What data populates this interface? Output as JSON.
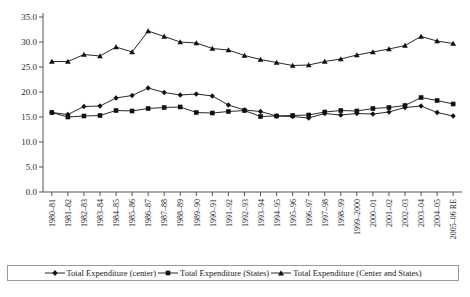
{
  "chart_data": {
    "type": "line",
    "title": "",
    "xlabel": "",
    "ylabel": "",
    "ylim": [
      0.0,
      35.0
    ],
    "yticks": [
      "0.0",
      "5.0",
      "10.0",
      "15.0",
      "20.0",
      "25.0",
      "30.0",
      "35.0"
    ],
    "ytick_values": [
      0.0,
      5.0,
      10.0,
      15.0,
      20.0,
      25.0,
      30.0,
      35.0
    ],
    "grid": false,
    "legend_position": "bottom",
    "categories": [
      "1980–81",
      "1981–82",
      "1982–83",
      "1983–84",
      "1984–85",
      "1985–86",
      "1986–87",
      "1987–88",
      "1988–89",
      "1989–90",
      "1990–91",
      "1991–92",
      "1992–93",
      "1993–94",
      "1994–95",
      "1995–96",
      "1996–97",
      "1997–98",
      "1998–99",
      "1999–2000",
      "2000–01",
      "2001–02",
      "2002–03",
      "2003–04",
      "2004–05",
      "2005–06 RE"
    ],
    "series": [
      {
        "name": "Total Expenditure (center)",
        "marker": "diamond",
        "color": "#111111",
        "values": [
          15.9,
          15.5,
          17.1,
          17.2,
          18.8,
          19.3,
          20.8,
          19.9,
          19.4,
          19.6,
          19.2,
          17.4,
          16.4,
          16.1,
          15.2,
          15.1,
          14.8,
          15.7,
          15.4,
          15.7,
          15.6,
          16.0,
          16.9,
          17.2,
          15.9,
          15.2
        ]
      },
      {
        "name": "Total Expenditure (States)",
        "marker": "square",
        "color": "#111111",
        "values": [
          15.9,
          15.0,
          15.2,
          15.3,
          16.3,
          16.2,
          16.7,
          16.9,
          17.0,
          15.9,
          15.8,
          16.1,
          16.3,
          15.1,
          15.2,
          15.3,
          15.4,
          16.0,
          16.3,
          16.2,
          16.7,
          16.9,
          17.3,
          18.9,
          18.3,
          17.6
        ]
      },
      {
        "name": "Total Expenditure (Center and States)",
        "marker": "triangle",
        "color": "#111111",
        "values": [
          26.1,
          26.1,
          27.5,
          27.2,
          29.0,
          28.0,
          32.2,
          31.1,
          30.0,
          29.8,
          28.7,
          28.4,
          27.3,
          26.5,
          25.9,
          25.3,
          25.4,
          26.1,
          26.6,
          27.4,
          28.0,
          28.6,
          29.3,
          31.1,
          30.2,
          29.7
        ]
      }
    ]
  },
  "legend": {
    "items": [
      {
        "label": "Total Expenditure (center)",
        "marker": "diamond"
      },
      {
        "label": "Total Expenditure (States)",
        "marker": "square"
      },
      {
        "label": "Total Expenditure (Center and States)",
        "marker": "triangle"
      }
    ]
  }
}
